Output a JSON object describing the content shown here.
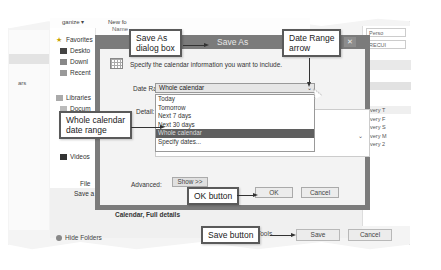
{
  "explorer": {
    "toolbar": [
      "ganize ▾",
      "New fo"
    ],
    "name_column": "Name",
    "left_partial_label": "ars",
    "nav": [
      {
        "label": "Favorites",
        "icon": "star-icon"
      },
      {
        "label": "Deskto",
        "icon": "desktop-icon"
      },
      {
        "label": "Downl",
        "icon": "downloads-icon"
      },
      {
        "label": "Recent",
        "icon": "recent-icon"
      },
      {
        "label": "Libraries",
        "icon": "libraries-icon"
      },
      {
        "label": "Docum",
        "icon": "documents-icon"
      },
      {
        "label": "Videos",
        "icon": "videos-icon"
      }
    ],
    "file_name_label": "File",
    "save_as_type_label": "Save a",
    "hide_folders": "Hide Folders",
    "tools_label": "Tools",
    "save_button": "Save",
    "cancel_button": "Cancel"
  },
  "right_pane": {
    "field1": "Perso",
    "field2": "RECUI",
    "recurrence": [
      "every T",
      "every F",
      "every S",
      "every M",
      "every 2"
    ]
  },
  "dialog": {
    "title": "Save As",
    "close": "✕",
    "description": "Specify the calendar information you want to include.",
    "date_range_label": "Date Range:",
    "date_range_value": "Whole calendar",
    "date_range_options": [
      "Today",
      "Tomorrow",
      "Next 7 days",
      "Next 30 days",
      "Whole calendar",
      "Specify dates..."
    ],
    "selected_option_index": 4,
    "detail_label": "Detail:",
    "advanced_label": "Advanced:",
    "show_button": "Show >>",
    "ok_button": "OK",
    "cancel_button": "Cancel",
    "footer_text": "Calendar, Full details"
  },
  "callouts": {
    "save_as_dialog": "Save As\ndialog box",
    "date_range_arrow": "Date Range\narrow",
    "whole_calendar": "Whole calendar\ndate range",
    "ok_button": "OK button",
    "save_button": "Save button"
  },
  "colors": {
    "dialog_frame": "#7b7b7b",
    "selected_option": "#5f5f5f",
    "callout_border": "#5a5a5a"
  }
}
